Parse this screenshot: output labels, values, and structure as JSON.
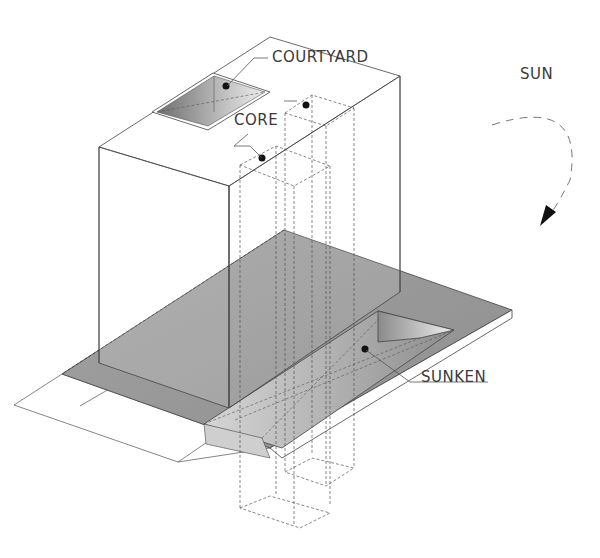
{
  "diagram": {
    "type": "axonometric-architectural-diagram",
    "labels": {
      "courtyard": "COURTYARD",
      "core": "CORE",
      "sun": "SUN",
      "sunken": "SUNKEN"
    },
    "colors": {
      "line": "#444444",
      "podium_fill": "#9a9a9a",
      "background": "#ffffff",
      "arrow": "#111111"
    },
    "elements": [
      "tower-block",
      "courtyard-void",
      "core-shafts",
      "podium-deck",
      "sunken-court",
      "ground-plane",
      "sun-path-arrow"
    ]
  }
}
